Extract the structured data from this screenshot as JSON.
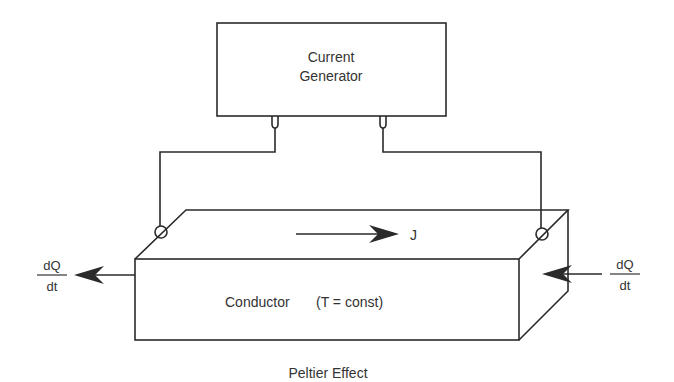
{
  "diagram": {
    "caption": "Peltier Effect",
    "generator": {
      "line1": "Current",
      "line2": "Generator"
    },
    "conductor": {
      "label": "Conductor",
      "condition": "(T = const)"
    },
    "current_label": "J",
    "heat_left": {
      "numerator": "dQ",
      "denominator": "dt",
      "direction": "out"
    },
    "heat_right": {
      "numerator": "dQ",
      "denominator": "dt",
      "direction": "in"
    },
    "colors": {
      "stroke": "#2a2a2a",
      "text": "#333333",
      "background": "#ffffff"
    }
  }
}
